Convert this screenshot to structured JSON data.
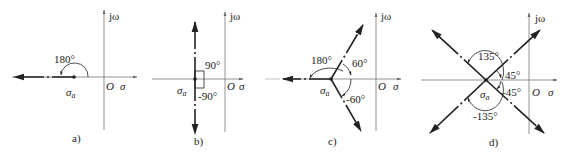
{
  "figure": {
    "panels": [
      {
        "id": "a",
        "caption": "a)",
        "axis_labels": {
          "imag": "jω",
          "real": "σ",
          "origin": "O"
        },
        "centroid_label": "σa",
        "angles": [
          "180°"
        ]
      },
      {
        "id": "b",
        "caption": "b)",
        "axis_labels": {
          "imag": "jω",
          "real": "σ",
          "origin": "O"
        },
        "centroid_label": "σa",
        "angles": [
          "90°",
          "-90°"
        ]
      },
      {
        "id": "c",
        "caption": "c)",
        "axis_labels": {
          "imag": "jω",
          "real": "σ",
          "origin": "O"
        },
        "centroid_label": "σa",
        "angles": [
          "180°",
          "60°",
          "-60°"
        ]
      },
      {
        "id": "d",
        "caption": "d)",
        "axis_labels": {
          "imag": "jω",
          "real": "σ",
          "origin": "O"
        },
        "centroid_label": "σa",
        "angles": [
          "135°",
          "45°",
          "-45°",
          "-135°"
        ]
      }
    ]
  },
  "colors": {
    "axis": "#666666",
    "asymptote": "#222222",
    "text": "#222222"
  }
}
